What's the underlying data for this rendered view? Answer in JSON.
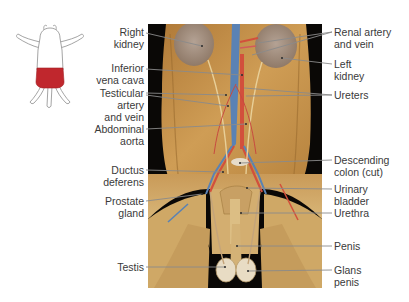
{
  "figure": {
    "type": "anatomical-dissection-photo",
    "orientation_icon": {
      "name": "pig-outline-icon",
      "highlight_region": "abdomen-and-pelvis",
      "highlight_color": "#c0272d"
    },
    "colors": {
      "background": "#000000",
      "tissue": "#c8964c",
      "tissue_light": "#dcb878",
      "kidney": "#a08a78",
      "vein_blue": "#5a82b4",
      "artery_red": "#d2503c",
      "leader_line": "#8a8a8a",
      "text": "#3a3a3a"
    }
  },
  "labels": {
    "left": [
      {
        "id": "right-kidney",
        "lines": [
          "Right",
          "kidney"
        ]
      },
      {
        "id": "inferior-vena-cava",
        "lines": [
          "Inferior",
          "vena cava"
        ]
      },
      {
        "id": "testicular-artery-vein",
        "lines": [
          "Testicular",
          "artery",
          "and vein"
        ]
      },
      {
        "id": "abdominal-aorta",
        "lines": [
          "Abdominal",
          "aorta"
        ]
      },
      {
        "id": "ductus-deferens",
        "lines": [
          "Ductus",
          "deferens"
        ]
      },
      {
        "id": "prostate-gland",
        "lines": [
          "Prostate",
          "gland"
        ]
      },
      {
        "id": "testis",
        "lines": [
          "Testis"
        ]
      }
    ],
    "right": [
      {
        "id": "renal-artery-vein",
        "lines": [
          "Renal artery",
          "and vein"
        ]
      },
      {
        "id": "left-kidney",
        "lines": [
          "Left",
          "kidney"
        ]
      },
      {
        "id": "ureters",
        "lines": [
          "Ureters"
        ]
      },
      {
        "id": "descending-colon",
        "lines": [
          "Descending",
          "colon (cut)"
        ]
      },
      {
        "id": "urinary-bladder",
        "lines": [
          "Urinary",
          "bladder"
        ]
      },
      {
        "id": "urethra",
        "lines": [
          "Urethra"
        ]
      },
      {
        "id": "penis",
        "lines": [
          "Penis"
        ]
      },
      {
        "id": "glans-penis",
        "lines": [
          "Glans",
          "penis"
        ]
      }
    ]
  }
}
